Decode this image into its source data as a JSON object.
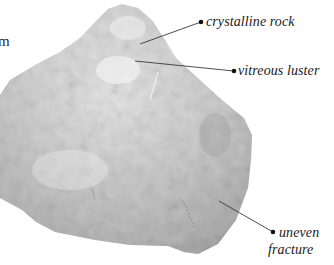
{
  "figure": {
    "edge_fragment_text": "m",
    "labels": [
      {
        "id": "crystalline",
        "text": "crystalline rock"
      },
      {
        "id": "vitreous",
        "text": "vitreous luster"
      },
      {
        "id": "uneven",
        "line1": "uneven",
        "line2": "fracture"
      }
    ]
  },
  "colors": {
    "background": "#ffffff",
    "rock_light": "#e4e4e4",
    "rock_mid": "#c9c9c9",
    "rock_dark": "#a8a8a8",
    "leader_line": "#3a3a3a",
    "text": "#1a1a1a"
  }
}
